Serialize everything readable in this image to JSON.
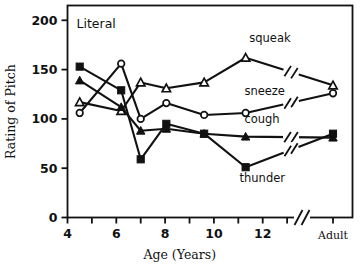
{
  "chart_data": {
    "type": "line",
    "title": "Literal",
    "xlabel": "Age (Years)",
    "ylabel": "Rating of Pitch",
    "xlim": [
      4,
      13.2
    ],
    "ylim": [
      0,
      215
    ],
    "grid": false,
    "legend": "inline-labels",
    "y_ticks": [
      0,
      50,
      100,
      150,
      200
    ],
    "y_tick_labels": [
      "0",
      "50",
      "100",
      "150",
      "200"
    ],
    "x_ticks": [
      4,
      5,
      6,
      7,
      8,
      9,
      10,
      11,
      12,
      13
    ],
    "x_tick_labels": [
      "4",
      "",
      "6",
      "",
      "8",
      "",
      "10",
      "",
      "12",
      ""
    ],
    "x_category_label": "Adult",
    "axis_break": true,
    "axis_break_note": "x axis broken between 13 and Adult; each series line also broken",
    "series": [
      {
        "name": "squeak",
        "marker": "open-triangle",
        "x": [
          4.5,
          6.2,
          7.0,
          8.05,
          9.6,
          11.3,
          "Adult"
        ],
        "values": [
          117,
          108,
          137,
          131,
          137,
          162,
          134
        ]
      },
      {
        "name": "sneeze",
        "marker": "open-circle",
        "x": [
          4.5,
          6.2,
          7.0,
          8.05,
          9.6,
          11.3,
          "Adult"
        ],
        "values": [
          106,
          156,
          100,
          116,
          104,
          106,
          126
        ]
      },
      {
        "name": "cough",
        "marker": "filled-triangle",
        "x": [
          4.5,
          6.2,
          7.0,
          8.05,
          9.6,
          11.3,
          "Adult"
        ],
        "values": [
          139,
          112,
          88,
          90,
          85,
          82,
          81
        ]
      },
      {
        "name": "thunder",
        "marker": "filled-square",
        "x": [
          4.5,
          6.2,
          7.0,
          8.05,
          9.6,
          11.3,
          "Adult"
        ],
        "values": [
          153,
          129,
          59,
          95,
          85,
          51,
          85
        ]
      }
    ],
    "annotations": [
      {
        "text": "squeak",
        "x": 11.45,
        "y": 178
      },
      {
        "text": "sneeze",
        "x": 11.25,
        "y": 124
      },
      {
        "text": "cough",
        "x": 11.25,
        "y": 96
      },
      {
        "text": "thunder",
        "x": 11.05,
        "y": 36
      }
    ]
  }
}
